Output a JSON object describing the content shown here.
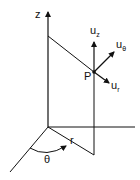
{
  "diagram": {
    "labels": {
      "z_axis": "z",
      "point": "P",
      "radius": "r",
      "angle": "θ",
      "u_z": {
        "base": "u",
        "sub": "z"
      },
      "u_theta": {
        "base": "u",
        "sub": "θ"
      },
      "u_r": {
        "base": "u",
        "sub": "r"
      }
    },
    "colors": {
      "stroke": "#111111",
      "background": "#ffffff"
    }
  }
}
